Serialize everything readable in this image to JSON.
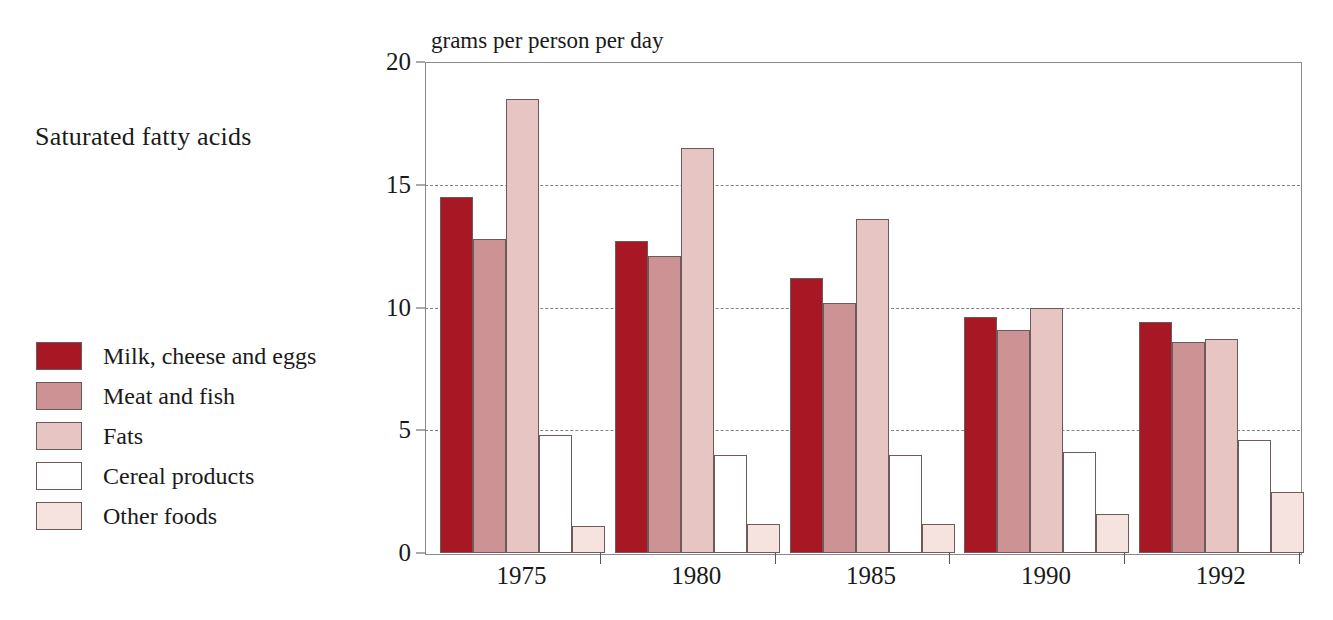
{
  "chart_title": "Saturated fatty acids",
  "axis_title": "grams per person per day",
  "legend": {
    "items": [
      {
        "label": "Milk, cheese and eggs",
        "color": "#a81824",
        "swatch_name": "legend-swatch-milk-cheese-eggs"
      },
      {
        "label": "Meat and fish",
        "color": "#cd9294",
        "swatch_name": "legend-swatch-meat-fish"
      },
      {
        "label": "Fats",
        "color": "#e6c5c2",
        "swatch_name": "legend-swatch-fats"
      },
      {
        "label": "Cereal products",
        "color": "#ffffff",
        "swatch_name": "legend-swatch-cereal-products"
      },
      {
        "label": "Other foods",
        "color": "#f6e2de",
        "swatch_name": "legend-swatch-other-foods"
      }
    ]
  },
  "yaxis": {
    "ticks": [
      "0",
      "5",
      "10",
      "15",
      "20"
    ],
    "min": 0,
    "max": 20
  },
  "chart_data": {
    "type": "bar",
    "title": "Saturated fatty acids",
    "subtitle": "grams per person per day",
    "xlabel": "",
    "ylabel": "grams per person per day",
    "ylim": [
      0,
      20
    ],
    "yticks": [
      0,
      5,
      10,
      15,
      20
    ],
    "grid": "horizontal-dashed",
    "legend_position": "left",
    "categories": [
      "1975",
      "1980",
      "1985",
      "1990",
      "1992"
    ],
    "series": [
      {
        "name": "Milk, cheese and eggs",
        "color": "#a81824",
        "values": [
          14.5,
          12.7,
          11.2,
          9.6,
          9.4
        ]
      },
      {
        "name": "Meat and fish",
        "color": "#cd9294",
        "values": [
          12.8,
          12.1,
          10.2,
          9.1,
          8.6
        ]
      },
      {
        "name": "Fats",
        "color": "#e6c5c2",
        "values": [
          18.5,
          16.5,
          13.6,
          10.0,
          8.7
        ]
      },
      {
        "name": "Cereal products",
        "color": "#ffffff",
        "values": [
          4.8,
          4.0,
          4.0,
          4.1,
          4.6
        ]
      },
      {
        "name": "Other foods",
        "color": "#f6e2de",
        "values": [
          1.1,
          1.2,
          1.2,
          1.6,
          2.5
        ]
      }
    ]
  }
}
